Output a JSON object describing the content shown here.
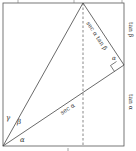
{
  "diagram": {
    "labels": {
      "gamma": "γ",
      "beta": "β",
      "alpha_origin": "α",
      "alpha_corner": "α",
      "sec_alpha": "sec α",
      "sec_alpha_tan_beta": "sec α tan β",
      "tan_beta": "tan β",
      "tan_alpha": "tan α",
      "bottom_tick": "1"
    },
    "colors": {
      "stroke": "#444444",
      "text": "#333333"
    }
  }
}
